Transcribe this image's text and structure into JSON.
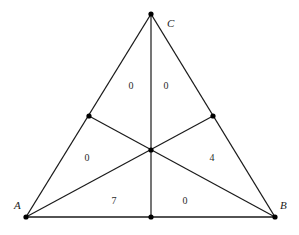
{
  "diagram": {
    "title": "",
    "type": "triangle-with-medians",
    "vertices": {
      "A": {
        "label": "A",
        "x": 26,
        "y": 217,
        "label_x": 14,
        "label_y": 209
      },
      "B": {
        "label": "B",
        "x": 275,
        "y": 217,
        "label_x": 280,
        "label_y": 209
      },
      "C": {
        "label": "C",
        "x": 151,
        "y": 14,
        "label_x": 167,
        "label_y": 27
      }
    },
    "midpoints": {
      "AC": {
        "x": 89,
        "y": 116
      },
      "BC": {
        "x": 213,
        "y": 116
      },
      "AB": {
        "x": 151,
        "y": 217
      }
    },
    "centroid": {
      "x": 151,
      "y": 150
    },
    "regions": [
      {
        "id": "upper-left",
        "value": "0",
        "x": 131,
        "y": 89
      },
      {
        "id": "upper-right",
        "value": "0",
        "x": 166,
        "y": 89
      },
      {
        "id": "middle-left",
        "value": "0",
        "x": 87,
        "y": 161
      },
      {
        "id": "middle-right",
        "value": "4",
        "x": 212,
        "y": 161
      },
      {
        "id": "lower-left",
        "value": "7",
        "x": 114,
        "y": 204
      },
      {
        "id": "lower-right",
        "value": "0",
        "x": 185,
        "y": 204
      }
    ],
    "colors": {
      "line": "#1a1a1a",
      "dot": "#000000",
      "text": "#2a2a2a",
      "background": "#ffffff"
    }
  }
}
